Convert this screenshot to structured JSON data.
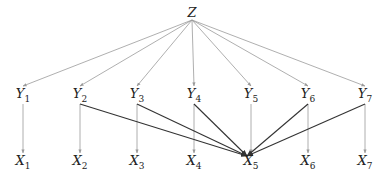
{
  "diagram": {
    "root": {
      "id": "Z",
      "label": "Z",
      "x": 192,
      "y": 12
    },
    "middle": [
      {
        "id": "Y1",
        "base": "Y",
        "sub": "1",
        "x": 23,
        "y": 95
      },
      {
        "id": "Y2",
        "base": "Y",
        "sub": "2",
        "x": 80,
        "y": 95
      },
      {
        "id": "Y3",
        "base": "Y",
        "sub": "3",
        "x": 137,
        "y": 95
      },
      {
        "id": "Y4",
        "base": "Y",
        "sub": "4",
        "x": 194,
        "y": 95
      },
      {
        "id": "Y5",
        "base": "Y",
        "sub": "5",
        "x": 251,
        "y": 95
      },
      {
        "id": "Y6",
        "base": "Y",
        "sub": "6",
        "x": 308,
        "y": 95
      },
      {
        "id": "Y7",
        "base": "Y",
        "sub": "7",
        "x": 365,
        "y": 95
      }
    ],
    "bottom": [
      {
        "id": "X1",
        "base": "X",
        "sub": "1",
        "x": 23,
        "y": 162
      },
      {
        "id": "X2",
        "base": "X",
        "sub": "2",
        "x": 80,
        "y": 162
      },
      {
        "id": "X3",
        "base": "X",
        "sub": "3",
        "x": 137,
        "y": 162
      },
      {
        "id": "X4",
        "base": "X",
        "sub": "4",
        "x": 194,
        "y": 162
      },
      {
        "id": "X5",
        "base": "X",
        "sub": "5",
        "x": 251,
        "y": 162
      },
      {
        "id": "X6",
        "base": "X",
        "sub": "6",
        "x": 308,
        "y": 162
      },
      {
        "id": "X7",
        "base": "X",
        "sub": "7",
        "x": 365,
        "y": 162
      }
    ],
    "edges_gray": [
      [
        "Z",
        "Y1"
      ],
      [
        "Z",
        "Y2"
      ],
      [
        "Z",
        "Y3"
      ],
      [
        "Z",
        "Y4"
      ],
      [
        "Z",
        "Y5"
      ],
      [
        "Z",
        "Y6"
      ],
      [
        "Z",
        "Y7"
      ],
      [
        "Y1",
        "X1"
      ],
      [
        "Y2",
        "X2"
      ],
      [
        "Y3",
        "X3"
      ],
      [
        "Y4",
        "X4"
      ],
      [
        "Y5",
        "X5"
      ],
      [
        "Y6",
        "X6"
      ],
      [
        "Y7",
        "X7"
      ]
    ],
    "edges_dark": [
      [
        "Y2",
        "X5"
      ],
      [
        "Y3",
        "X5"
      ],
      [
        "Y4",
        "X5"
      ],
      [
        "Y6",
        "X5"
      ],
      [
        "Y7",
        "X5"
      ]
    ],
    "colors": {
      "gray": "#9a9a9a",
      "dark": "#333333"
    }
  }
}
